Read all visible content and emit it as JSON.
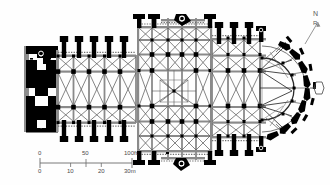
{
  "figure": {
    "type": "architectural-floor-plan",
    "orientation": "liturgical east at right",
    "background_color": "#fefefe",
    "ink_color": "#000000",
    "rib_color": "#4d4d4d",
    "wall_gray": "#9a9a9a"
  },
  "north_arrow": {
    "name": "north-arrow",
    "label_n": "N",
    "label_sub": "R",
    "angle_deg": 24
  },
  "scale_bar": {
    "name": "scale-bar",
    "imperial": {
      "ticks": [
        "0",
        "50",
        "100ft"
      ],
      "tick_positions_pct": [
        0,
        50,
        100
      ],
      "unit": "ft",
      "max": 100
    },
    "metric": {
      "ticks": [
        "0",
        "10",
        "20",
        "30m"
      ],
      "tick_positions_pct": [
        0,
        33.3,
        66.6,
        100
      ],
      "unit": "m",
      "max": 30
    }
  },
  "plan_geometry": {
    "west_front": {
      "x": 24,
      "y": 46,
      "w": 34,
      "h": 86
    },
    "nave": {
      "x": 58,
      "y": 52,
      "w": 78,
      "h": 74,
      "bays": 5,
      "aisles": 2
    },
    "transept": {
      "x": 136,
      "y": 16,
      "w": 76,
      "h": 146
    },
    "crossing": {
      "x": 152,
      "y": 70,
      "w": 44,
      "h": 42
    },
    "choir": {
      "x": 212,
      "y": 34,
      "w": 52,
      "h": 110,
      "bays": 3
    },
    "apse": {
      "cx": 266,
      "cy": 89,
      "r_inner": 28,
      "r_outer": 46,
      "rays": 13
    },
    "nave_pier_spacing": 15.5,
    "buttress_count_north": 6,
    "buttress_count_south": 6
  }
}
